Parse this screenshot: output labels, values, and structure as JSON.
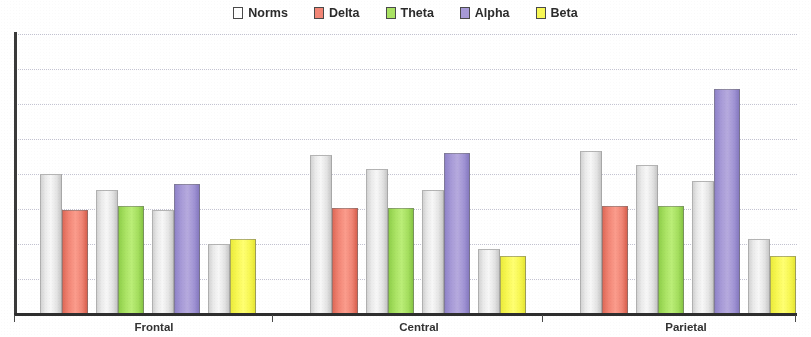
{
  "legend": {
    "items": [
      {
        "label": "Norms",
        "color": "#f7f7f7",
        "key": "norms"
      },
      {
        "label": "Delta",
        "color": "#f28676",
        "key": "delta"
      },
      {
        "label": "Theta",
        "color": "#a9e263",
        "key": "theta"
      },
      {
        "label": "Alpha",
        "color": "#a79ad7",
        "key": "alpha"
      },
      {
        "label": "Beta",
        "color": "#f8f855",
        "key": "beta"
      }
    ]
  },
  "axis": {
    "categories": [
      "Frontal",
      "Central",
      "Parietal"
    ],
    "gridline_count": 8
  },
  "chart_data": {
    "type": "bar",
    "title": "",
    "subtitle": "",
    "xlabel": "",
    "ylabel": "",
    "ylim": [
      0,
      1.0
    ],
    "grid": true,
    "legend_position": "top-center",
    "categories": [
      "Frontal",
      "Central",
      "Parietal"
    ],
    "band_order": [
      "Delta",
      "Theta",
      "Alpha",
      "Beta"
    ],
    "series": [
      {
        "name": "Norms",
        "color": "#f7f7f7",
        "values_by_band": {
          "Frontal": [
            0.495,
            0.437,
            0.366,
            0.247
          ],
          "Central": [
            0.563,
            0.513,
            0.437,
            0.226
          ],
          "Parietal": [
            0.577,
            0.527,
            0.47,
            0.262
          ]
        }
      },
      {
        "name": "Delta",
        "color": "#f28676",
        "values": [
          0.366,
          0.373,
          0.38
        ]
      },
      {
        "name": "Theta",
        "color": "#a9e263",
        "values": [
          0.38,
          0.373,
          0.38
        ]
      },
      {
        "name": "Alpha",
        "color": "#a79ad7",
        "values": [
          0.459,
          0.57,
          0.796
        ]
      },
      {
        "name": "Beta",
        "color": "#f8f855",
        "values": [
          0.262,
          0.204,
          0.204
        ]
      }
    ]
  }
}
